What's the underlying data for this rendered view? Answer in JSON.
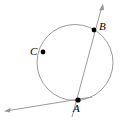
{
  "figure": {
    "kind": "geometry-diagram",
    "width": 120,
    "height": 120,
    "background_color": "#ffffff",
    "stroke_color": "#9a9a9a",
    "point_color": "#000000",
    "label_color": "#000000"
  },
  "circle": {
    "name": "circle",
    "center_x": 75,
    "center_y": 62.5,
    "radius": 38
  },
  "points": [
    {
      "id": "C",
      "label": "C",
      "x": 43,
      "y": 52,
      "label_x": 30,
      "label_y": 46
    },
    {
      "id": "B",
      "label": "B",
      "x": 94,
      "y": 30,
      "label_x": 99,
      "label_y": 21
    },
    {
      "id": "A",
      "label": "A",
      "x": 78,
      "y": 100,
      "label_x": 73,
      "label_y": 103
    }
  ],
  "rays": [
    {
      "id": "secant-AB",
      "label": "secant through A and B",
      "from_x": 72,
      "from_y": 117,
      "to_x": 103,
      "to_y": 4,
      "arrow_at": "to"
    },
    {
      "id": "tangent-at-A",
      "label": "tangent ray at A",
      "from_x": 92,
      "from_y": 97,
      "to_x": 4,
      "to_y": 111,
      "arrow_at": "to"
    }
  ]
}
